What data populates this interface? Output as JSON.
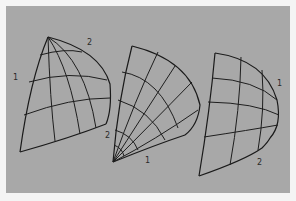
{
  "figure": {
    "background_color": "#a8a8a8",
    "line_color": "#1e1e1e",
    "shapes": [
      {
        "id": "shape-1",
        "labels": [
          {
            "text": "1",
            "x": 13,
            "y": 80
          },
          {
            "text": "2",
            "x": 87,
            "y": 45
          }
        ]
      },
      {
        "id": "shape-2",
        "labels": [
          {
            "text": "2",
            "x": 105,
            "y": 138
          },
          {
            "text": "1",
            "x": 145,
            "y": 163
          }
        ]
      },
      {
        "id": "shape-3",
        "labels": [
          {
            "text": "1",
            "x": 277,
            "y": 86
          },
          {
            "text": "2",
            "x": 257,
            "y": 165
          }
        ]
      }
    ]
  }
}
